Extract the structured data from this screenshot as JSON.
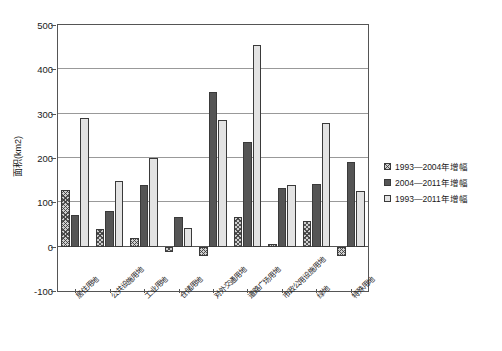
{
  "chart_data": {
    "type": "bar",
    "title": "",
    "xlabel": "",
    "ylabel": "面积(km2)",
    "ylim": [
      -100,
      500
    ],
    "ytick_values": [
      -100,
      0,
      100,
      200,
      300,
      400,
      500
    ],
    "ytick_labels": [
      "-100",
      "0",
      "100",
      "200",
      "300",
      "400",
      "500"
    ],
    "grid": true,
    "grid_axis": "y",
    "legend_position": "right",
    "categories": [
      "居住用地",
      "公共设施用地",
      "工业用地",
      "仓储用地",
      "对外交通用地",
      "道路广场用地",
      "市政公用设施用地",
      "绿地",
      "特殊用地"
    ],
    "series": [
      {
        "name": "1993—2004年增幅",
        "color": "#cfcfcf",
        "pattern": "cross-hatch",
        "values": [
          127,
          40,
          20,
          -12,
          -22,
          68,
          5,
          58,
          -20
        ]
      },
      {
        "name": "2004—2011年增幅",
        "color": "#555555",
        "pattern": "solid-dark",
        "values": [
          72,
          80,
          140,
          68,
          348,
          235,
          133,
          142,
          190
        ]
      },
      {
        "name": "1993—2011年增幅",
        "color": "#e3e3e3",
        "pattern": "solid-light",
        "values": [
          290,
          148,
          200,
          42,
          285,
          455,
          140,
          280,
          125
        ]
      }
    ]
  },
  "legend": {
    "items": [
      "1993—2004年增幅",
      "2004—2011年增幅",
      "1993—2011年增幅"
    ]
  }
}
